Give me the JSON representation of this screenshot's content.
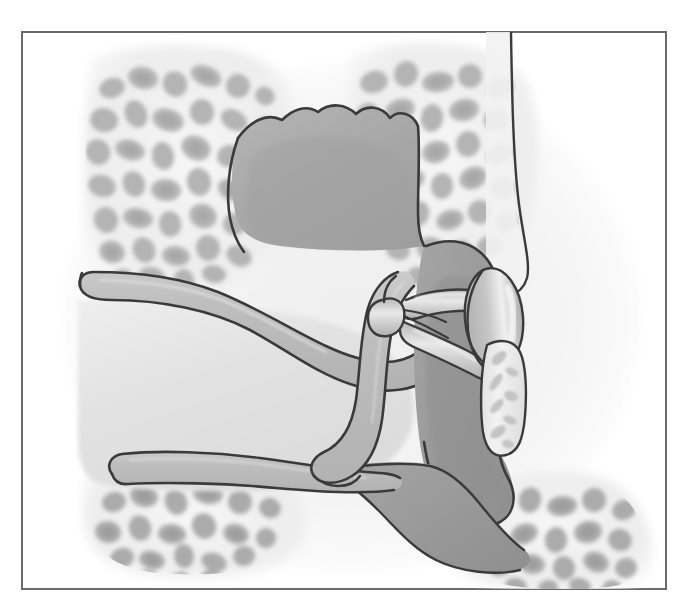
{
  "figure": {
    "domain": "anatomical-illustration",
    "caption_text": "",
    "width_px": 684,
    "height_px": 604,
    "background_color": "#ffffff",
    "has_text_labels": false,
    "has_leader_lines": false,
    "style": "grayscale airbrush medical illustration with ink outlines"
  },
  "frame": {
    "name": "illustration-border",
    "x": 21,
    "y": 31,
    "width": 646,
    "height": 559,
    "stroke_color": "#6b6b6b",
    "stroke_width": 2,
    "fill_color": "#ffffff"
  },
  "palette": {
    "ink_outline": "#3a3a3a",
    "soft_tissue_mid": "#a9a9a9",
    "soft_tissue_dark": "#9a9a9a",
    "canal_lumen_light": "#e2e2e2",
    "bone_matrix_pale": "#efefef",
    "bone_cell_gray": "#b9b9b9",
    "bone_cell_gray_dark": "#a3a3a3",
    "membrane_gray": "#c4c4c4",
    "highlight_white": "#f4f4f4",
    "page_white": "#ffffff"
  },
  "structures": [
    {
      "id": "mastoid-air-cells-upper-left",
      "label": "Mastoid air cells (superior-lateral)",
      "region": "upper-left",
      "fill": "#efefef",
      "cell_fill": "#b6b6b6",
      "cell_count": 58,
      "interactable": false
    },
    {
      "id": "mastoid-air-cells-upper-right",
      "label": "Mastoid air cells (superior-medial)",
      "region": "upper-right",
      "fill": "#efefef",
      "cell_fill": "#b6b6b6",
      "cell_count": 40,
      "interactable": false
    },
    {
      "id": "mastoid-air-cells-lower-left",
      "label": "Mastoid air cells (inferior-lateral)",
      "region": "lower-left",
      "fill": "#efefef",
      "cell_fill": "#b0b0b0",
      "cell_count": 26,
      "interactable": false
    },
    {
      "id": "mastoid-air-cells-lower-right",
      "label": "Mastoid air cells (inferior-medial)",
      "region": "lower-right",
      "fill": "#efefef",
      "cell_fill": "#b0b0b0",
      "cell_count": 34,
      "interactable": false
    },
    {
      "id": "epitympanic-mass",
      "label": "Epitympanic soft-tissue mass (attic)",
      "region": "upper-center",
      "fill": "#a9a9a9",
      "outline": "#3a3a3a",
      "interactable": false
    },
    {
      "id": "external-auditory-canal-superior-wall",
      "label": "Superior wall of external auditory canal",
      "region": "left-upper",
      "fill": "#bdbdbd",
      "outline": "#3a3a3a",
      "interactable": false
    },
    {
      "id": "external-auditory-canal-inferior-wall",
      "label": "Inferior wall of external auditory canal",
      "region": "left-lower",
      "fill": "#bdbdbd",
      "outline": "#3a3a3a",
      "interactable": false
    },
    {
      "id": "external-auditory-canal-lumen",
      "label": "External auditory canal lumen",
      "region": "center-left",
      "fill": "#e2e2e2",
      "interactable": false
    },
    {
      "id": "tympanic-membrane",
      "label": "Tympanic membrane (eardrum)",
      "region": "center",
      "fill": "#bdbdbd",
      "outline": "#3a3a3a",
      "interactable": false
    },
    {
      "id": "tympanic-cavity-soft-tissue",
      "label": "Tympanic cavity soft tissue",
      "region": "center-right",
      "fill": "#9a9a9a",
      "outline": "#3a3a3a",
      "interactable": false
    },
    {
      "id": "stapes-head-and-crura",
      "label": "Stapes — head, anterior and posterior crura",
      "region": "center-right",
      "fill": "#cfcfcf",
      "outline": "#3a3a3a",
      "interactable": false
    },
    {
      "id": "stapes-footplate-oval-window",
      "label": "Stapes footplate in oval window",
      "region": "right-center",
      "fill": "#c0c0c0",
      "outline": "#3a3a3a",
      "interactable": false
    },
    {
      "id": "bony-ridge-fragment",
      "label": "Bony ridge fragment (promontory edge)",
      "region": "right-lower",
      "fill": "#e8e8e8",
      "outline": "#3a3a3a",
      "interactable": false
    },
    {
      "id": "temporal-bone-medial-margin",
      "label": "Medial margin of temporal bone",
      "region": "right-edge",
      "fill": "#efefef",
      "outline": "#3a3a3a",
      "interactable": false
    },
    {
      "id": "hypotympanic-soft-tissue",
      "label": "Hypotympanic soft-tissue extension",
      "region": "bottom-center-right",
      "fill": "#9a9a9a",
      "outline": "#3a3a3a",
      "interactable": false
    }
  ],
  "chart_data": {
    "type": "table",
    "columns": [
      "region",
      "tone_hex",
      "approx_luminance"
    ],
    "rows": [
      [
        "page background",
        "#ffffff",
        255
      ],
      [
        "bone matrix (pale)",
        "#efefef",
        239
      ],
      [
        "canal lumen",
        "#e2e2e2",
        226
      ],
      [
        "membrane / ossicle",
        "#c4c4c4",
        196
      ],
      [
        "bone air-cell gray",
        "#b6b6b6",
        182
      ],
      [
        "soft tissue mid",
        "#a9a9a9",
        169
      ],
      [
        "soft tissue dark",
        "#9a9a9a",
        154
      ],
      [
        "ink outline",
        "#3a3a3a",
        58
      ],
      [
        "frame border",
        "#6b6b6b",
        107
      ]
    ]
  }
}
